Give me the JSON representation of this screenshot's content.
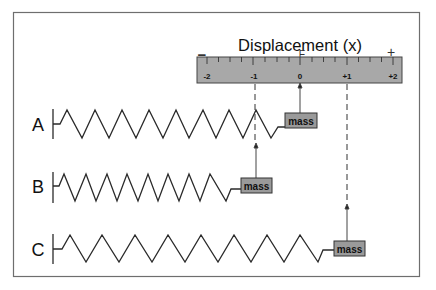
{
  "title": "Displacement (x)",
  "ruler": {
    "minus_sign": "−",
    "equilibrium_mark": "E",
    "plus_sign": "+",
    "ticks": [
      "-2",
      "-1",
      "0",
      "+1",
      "+2"
    ],
    "fill_color": "#a8a8a8"
  },
  "springs": [
    {
      "label": "A",
      "mass_label": "mass",
      "position": "0",
      "marker": "solid arrow to 0"
    },
    {
      "label": "B",
      "mass_label": "mass",
      "position": "-1",
      "marker": "dashed line to -1"
    },
    {
      "label": "C",
      "mass_label": "mass",
      "position": "+1",
      "marker": "dashed line to +1"
    }
  ],
  "colors": {
    "line": "#2a2a2a",
    "frame": "#6e6e6e",
    "mass_fill": "#9a9a9a"
  }
}
